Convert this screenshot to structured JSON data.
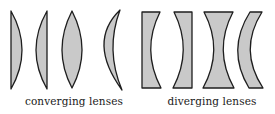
{
  "colors": {
    "lens_fill": "#c9c9c9",
    "lens_stroke": "#1e1e1e",
    "text": "#1a1a1a",
    "background": "#ffffff"
  },
  "groups": [
    {
      "label": "converging lenses",
      "lenses": [
        {
          "type": "plano-convex",
          "orientation": "flat-left"
        },
        {
          "type": "plano-convex",
          "orientation": "flat-right"
        },
        {
          "type": "biconvex"
        },
        {
          "type": "positive-meniscus"
        }
      ]
    },
    {
      "label": "diverging lenses",
      "lenses": [
        {
          "type": "plano-concave",
          "orientation": "flat-left"
        },
        {
          "type": "plano-concave",
          "orientation": "flat-right"
        },
        {
          "type": "biconcave"
        },
        {
          "type": "negative-meniscus"
        }
      ]
    }
  ]
}
